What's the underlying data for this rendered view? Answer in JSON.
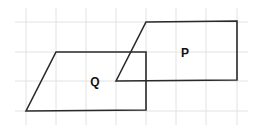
{
  "diagram": {
    "grid": {
      "vertical_x": [
        26,
        56,
        86,
        116,
        146,
        176,
        206,
        237
      ],
      "horizontal_y": [
        22,
        52,
        81,
        111
      ],
      "x_extent": [
        15,
        248
      ],
      "y_extent": [
        8,
        125
      ],
      "color": "#e2e2e2"
    },
    "shapes": [
      {
        "name": "Q",
        "label": "Q",
        "type": "parallelogram",
        "points": "26,111 56,52 146,52 146,110",
        "label_pos": [
          95,
          86
        ]
      },
      {
        "name": "P",
        "label": "P",
        "type": "parallelogram",
        "points": "116,81 146,22 237,21 237,80",
        "label_pos": [
          185,
          57
        ]
      }
    ],
    "stroke_color": "#2a2a2a"
  }
}
